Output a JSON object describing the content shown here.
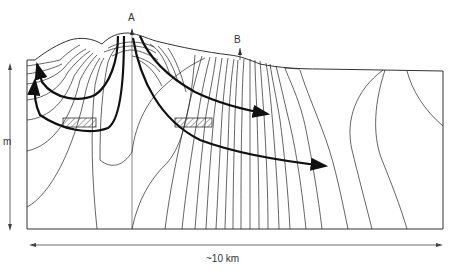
{
  "diagram": {
    "type": "groundwater flow net cross-section",
    "labels": {
      "point_a": "A",
      "point_b": "B",
      "vertical_axis": "m",
      "horizontal_axis": "~10 km"
    },
    "elements": {
      "well_markers": [
        "A",
        "B"
      ],
      "hatched_zones": 2,
      "flow_arrows": 4
    }
  }
}
